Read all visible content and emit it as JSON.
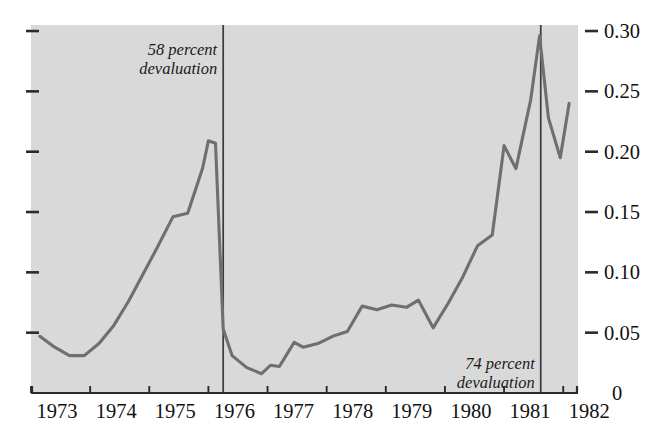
{
  "chart_data": {
    "type": "line",
    "title": "",
    "subtitle": "",
    "xlabel": "",
    "ylabel": "",
    "xlim": [
      1973.0,
      1982.25
    ],
    "ylim": [
      0.0,
      0.305
    ],
    "grid": false,
    "legend_position": "none",
    "y_tick_labels": [
      "0.30",
      "0.25",
      "0.20",
      "0.15",
      "0.10",
      "0.05",
      "0"
    ],
    "y_tick_values": [
      0.3,
      0.25,
      0.2,
      0.15,
      0.1,
      0.05,
      0.0
    ],
    "y_axis_side": "both",
    "x_tick_labels": [
      "1973",
      "1974",
      "1975",
      "1976",
      "1977",
      "1978",
      "1979",
      "1980",
      "1981",
      "1982"
    ],
    "x_tick_values": [
      1973,
      1974,
      1975,
      1976,
      1977,
      1978,
      1979,
      1980,
      1981,
      1982
    ],
    "series": [
      {
        "name": "exchange rate",
        "x": [
          1973.15,
          1973.4,
          1973.65,
          1973.9,
          1974.15,
          1974.4,
          1974.65,
          1974.9,
          1975.15,
          1975.4,
          1975.65,
          1975.9,
          1976.0,
          1976.12,
          1976.25,
          1976.4,
          1976.65,
          1976.9,
          1977.05,
          1977.2,
          1977.45,
          1977.6,
          1977.85,
          1978.1,
          1978.35,
          1978.6,
          1978.85,
          1979.1,
          1979.35,
          1979.55,
          1979.8,
          1980.05,
          1980.3,
          1980.55,
          1980.8,
          1981.0,
          1981.2,
          1981.45,
          1981.6,
          1981.75,
          1981.95,
          1982.1
        ],
        "values": [
          0.047,
          0.038,
          0.031,
          0.031,
          0.041,
          0.056,
          0.076,
          0.099,
          0.122,
          0.146,
          0.149,
          0.186,
          0.209,
          0.207,
          0.053,
          0.031,
          0.021,
          0.016,
          0.023,
          0.022,
          0.042,
          0.038,
          0.041,
          0.047,
          0.051,
          0.072,
          0.069,
          0.073,
          0.071,
          0.077,
          0.054,
          0.074,
          0.096,
          0.122,
          0.131,
          0.205,
          0.186,
          0.243,
          0.296,
          0.228,
          0.195,
          0.24
        ]
      }
    ],
    "annotations": [
      {
        "id": "devaluation-1976",
        "lines": [
          "58 percent",
          "devaluation"
        ],
        "x_position": 1976.25
      },
      {
        "id": "devaluation-1981",
        "lines": [
          "74 percent",
          "devaluation"
        ],
        "x_position": 1981.62
      }
    ],
    "event_lines": [
      1976.25,
      1981.62
    ],
    "colors": {
      "plot_background": "#d9d9d9",
      "line": "#6f6f6f",
      "axis": "#2b2b2b",
      "event_line": "#3a3a3a",
      "text": "#111111",
      "page_background": "#ffffff"
    }
  }
}
